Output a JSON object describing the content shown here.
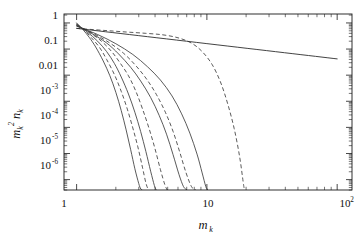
{
  "figure": {
    "background_color": "#ffffff",
    "axis_color": "#1a1a1a",
    "curve_color": "#3c3c3c"
  },
  "chart_data": {
    "type": "line",
    "title": "",
    "subtitle": "",
    "xlabel": "m_k",
    "ylabel": "m_k^2 n_k",
    "xscale": "log",
    "yscale": "log",
    "xlim": [
      0.8,
      130
    ],
    "ylim": [
      4e-07,
      2.2
    ],
    "grid": false,
    "legend": null,
    "legend_position": "none",
    "x_tick_labels": [
      "1",
      "10",
      "10",
      "2"
    ],
    "x_ticks": [
      1,
      10,
      100
    ],
    "y_ticks": [
      1,
      0.1,
      0.01,
      0.001,
      0.0001,
      1e-05,
      1e-06
    ],
    "y_tick_labels": [
      "1",
      "0.1",
      "0.01",
      "10",
      "-3",
      "10",
      "-4",
      "10",
      "-5",
      "10",
      "-6"
    ],
    "annotations": [],
    "series": [
      {
        "name": "solid-1",
        "style": "solid",
        "cutoff_mk": 3.2,
        "x": [
          1.0,
          1.12,
          1.25,
          1.4,
          1.6,
          1.8,
          2.0,
          2.2,
          2.4,
          2.6,
          2.8,
          3.0,
          3.1,
          3.18
        ],
        "y": [
          1.0,
          0.55,
          0.28,
          0.12,
          0.035,
          0.0095,
          0.0022,
          0.00044,
          8e-05,
          1.4e-05,
          2.6e-06,
          7e-07,
          4.5e-07,
          4e-07
        ]
      },
      {
        "name": "dashed-1",
        "style": "dashed",
        "cutoff_mk": 3.6,
        "x": [
          1.0,
          1.15,
          1.3,
          1.5,
          1.7,
          1.95,
          2.2,
          2.45,
          2.7,
          2.95,
          3.2,
          3.4,
          3.55
        ],
        "y": [
          0.92,
          0.52,
          0.27,
          0.115,
          0.04,
          0.0105,
          0.0024,
          0.0005,
          9.5e-05,
          1.8e-05,
          3e-06,
          7.5e-07,
          4e-07
        ]
      },
      {
        "name": "solid-2",
        "style": "solid",
        "cutoff_mk": 4.1,
        "x": [
          1.0,
          1.2,
          1.45,
          1.7,
          1.95,
          2.2,
          2.5,
          2.8,
          3.1,
          3.4,
          3.7,
          3.95,
          4.08
        ],
        "y": [
          0.88,
          0.46,
          0.2,
          0.08,
          0.028,
          0.0085,
          0.0019,
          0.00038,
          7e-05,
          1.2e-05,
          2.1e-06,
          6e-07,
          4e-07
        ]
      },
      {
        "name": "dashed-2",
        "style": "dashed",
        "cutoff_mk": 5.0,
        "x": [
          1.0,
          1.25,
          1.55,
          1.85,
          2.15,
          2.5,
          2.85,
          3.2,
          3.6,
          4.0,
          4.4,
          4.75,
          4.95
        ],
        "y": [
          0.85,
          0.44,
          0.2,
          0.082,
          0.03,
          0.0095,
          0.0024,
          0.00052,
          9e-05,
          1.5e-05,
          2.4e-06,
          6.5e-07,
          4e-07
        ]
      },
      {
        "name": "solid-3",
        "style": "solid",
        "cutoff_mk": 7.1,
        "x": [
          1.0,
          1.3,
          1.7,
          2.1,
          2.6,
          3.1,
          3.7,
          4.3,
          4.9,
          5.5,
          6.1,
          6.6,
          7.0
        ],
        "y": [
          0.8,
          0.4,
          0.17,
          0.065,
          0.02,
          0.006,
          0.0014,
          0.00029,
          5.5e-05,
          9e-06,
          1.6e-06,
          5.5e-07,
          4e-07
        ]
      },
      {
        "name": "dashed-3",
        "style": "dashed",
        "cutoff_mk": 8.3,
        "x": [
          1.0,
          1.35,
          1.8,
          2.3,
          2.85,
          3.45,
          4.1,
          4.8,
          5.5,
          6.2,
          6.9,
          7.6,
          8.2
        ],
        "y": [
          0.78,
          0.39,
          0.17,
          0.068,
          0.023,
          0.007,
          0.0018,
          0.00038,
          7e-05,
          1.1e-05,
          1.9e-06,
          5.5e-07,
          4e-07
        ]
      },
      {
        "name": "solid-4",
        "style": "solid",
        "cutoff_mk": 10.2,
        "x": [
          1.0,
          1.45,
          2.0,
          2.7,
          3.5,
          4.4,
          5.4,
          6.4,
          7.4,
          8.4,
          9.2,
          9.8,
          10.15
        ],
        "y": [
          0.75,
          0.36,
          0.16,
          0.062,
          0.021,
          0.0065,
          0.0016,
          0.00033,
          6e-05,
          9.5e-06,
          1.8e-06,
          5.5e-07,
          4e-07
        ]
      },
      {
        "name": "dashed-4",
        "style": "dashed",
        "cutoff_mk": 19.5,
        "x": [
          1.0,
          1.6,
          2.4,
          3.4,
          4.6,
          6.0,
          7.6,
          9.2,
          11.0,
          12.8,
          14.5,
          16.2,
          17.8,
          19.0,
          19.4
        ],
        "y": [
          0.62,
          0.52,
          0.45,
          0.4,
          0.35,
          0.27,
          0.17,
          0.08,
          0.025,
          0.005,
          0.00075,
          9e-05,
          8e-06,
          8e-07,
          4e-07
        ]
      },
      {
        "name": "power-law",
        "style": "solid",
        "description": "straight power-law line",
        "x": [
          1.0,
          100.0
        ],
        "y": [
          0.62,
          0.042
        ]
      }
    ]
  }
}
